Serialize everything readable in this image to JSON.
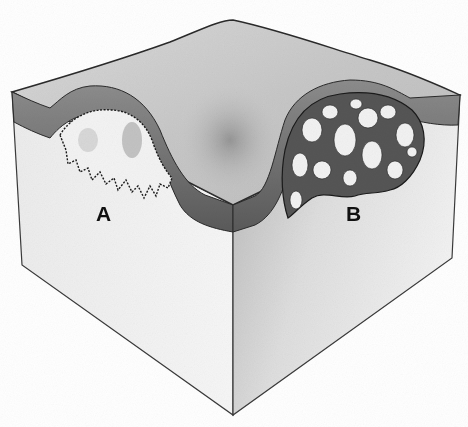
{
  "figure": {
    "labels": [
      {
        "id": "A",
        "text": "A"
      },
      {
        "id": "B",
        "text": "B"
      }
    ],
    "caption": ""
  },
  "colors": {
    "background": "#ffffff",
    "top_surface": "#cfcfcf",
    "top_surface_shadow": "#8f8f8f",
    "layer_band": "#6e6e6e",
    "left_face": "#f1f1f1",
    "right_face": "#d6d6d6",
    "lesion_fill": "#f4f4f4",
    "outline": "#2a2a2a"
  }
}
